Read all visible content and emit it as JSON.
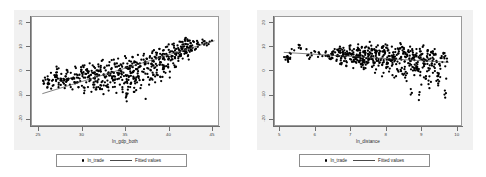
{
  "figure": {
    "background_color": "#ffffff",
    "plot_region_color": "#f1f1f1",
    "marker_color": "#000000",
    "fit_line_color": "#4a4a4a",
    "frame_color": "#9a9a9a"
  },
  "chart_data": [
    {
      "type": "scatter",
      "title": "",
      "xlabel": "ln_gdp_both",
      "ylabel": "",
      "xlim": [
        24.2,
        45.8
      ],
      "ylim": [
        -23.0,
        22.5
      ],
      "xticks": [
        25,
        30,
        35,
        40,
        45
      ],
      "yticks": [
        20,
        10,
        0,
        -10,
        -20
      ],
      "xtick_labels": [
        "25",
        "30",
        "35",
        "40",
        "45"
      ],
      "ytick_labels": [
        "20",
        "10",
        "0",
        "-10",
        "-20"
      ],
      "grid": false,
      "legend_position": "below",
      "legend": [
        "ln_trade",
        "Fitted values"
      ],
      "series": [
        {
          "name": "ln_trade",
          "kind": "scatter",
          "marker": "filled-circle",
          "x": [
            25.6,
            25.7,
            26.0,
            26.2,
            26.4,
            26.6,
            26.8,
            27.0,
            27.1,
            27.3,
            27.5,
            27.6,
            27.8,
            28.0,
            28.1,
            28.3,
            28.4,
            28.6,
            28.7,
            28.9,
            29.0,
            29.2,
            29.3,
            29.5,
            29.6,
            29.8,
            29.9,
            30.0,
            30.1,
            30.2,
            30.3,
            30.4,
            30.5,
            30.6,
            30.7,
            30.8,
            30.9,
            31.0,
            31.1,
            31.2,
            31.3,
            31.4,
            31.5,
            31.6,
            31.7,
            31.8,
            31.9,
            32.0,
            32.1,
            32.2,
            32.3,
            32.4,
            32.5,
            32.6,
            32.7,
            32.8,
            32.9,
            33.0,
            33.1,
            33.2,
            33.3,
            33.4,
            33.5,
            33.6,
            33.7,
            33.8,
            33.9,
            34.0,
            34.1,
            34.2,
            34.3,
            34.4,
            34.5,
            34.6,
            34.7,
            34.8,
            34.9,
            35.0,
            35.1,
            35.2,
            35.3,
            35.4,
            35.5,
            35.6,
            35.7,
            35.8,
            35.9,
            36.0,
            36.1,
            36.2,
            36.3,
            36.4,
            36.5,
            36.6,
            36.7,
            36.8,
            36.9,
            37.0,
            37.1,
            37.2,
            37.3,
            37.4,
            37.5,
            37.6,
            37.7,
            37.8,
            37.9,
            38.0,
            38.1,
            38.2,
            38.3,
            38.4,
            38.5,
            38.6,
            38.7,
            38.8,
            38.9,
            39.0,
            39.1,
            39.2,
            39.3,
            39.4,
            39.5,
            39.6,
            39.7,
            39.8,
            39.9,
            40.0,
            40.1,
            40.2,
            40.3,
            40.4,
            40.5,
            40.6,
            40.7,
            40.8,
            40.9,
            41.0,
            41.1,
            41.2,
            41.3,
            41.4,
            41.5,
            41.6,
            41.7,
            41.8,
            41.9,
            42.0,
            42.1,
            42.2,
            42.3,
            42.4,
            42.5,
            42.6,
            42.7,
            42.8,
            43.0,
            43.2,
            43.5,
            44.0,
            44.5,
            45.1
          ],
          "y": [
            -5.5,
            -3.0,
            -7.0,
            -4.0,
            -1.0,
            -6.5,
            -2.0,
            -4.5,
            0.5,
            -6.0,
            -3.5,
            -1.5,
            -5.0,
            -7.5,
            -2.5,
            0.0,
            -4.0,
            -6.0,
            -1.0,
            -8.0,
            -3.0,
            -5.5,
            1.0,
            -2.0,
            -7.0,
            -4.5,
            -0.5,
            -6.5,
            2.0,
            -3.0,
            -8.5,
            -1.5,
            -5.0,
            0.5,
            -7.0,
            -2.5,
            3.0,
            -4.0,
            -9.0,
            -1.0,
            -6.0,
            1.5,
            -3.5,
            -8.0,
            0.0,
            -5.0,
            2.5,
            -2.0,
            -7.5,
            -0.5,
            4.0,
            -4.5,
            -10.0,
            1.0,
            -3.0,
            -6.5,
            2.0,
            -1.5,
            -8.5,
            3.5,
            -5.0,
            0.5,
            -2.5,
            -7.0,
            4.5,
            -4.0,
            1.5,
            -9.5,
            -1.0,
            5.0,
            -3.5,
            -6.0,
            2.5,
            -0.5,
            -8.0,
            3.0,
            -5.5,
            6.0,
            -2.0,
            -13.0,
            1.0,
            -4.0,
            4.0,
            -7.0,
            2.0,
            -1.0,
            5.5,
            -3.0,
            -9.0,
            3.5,
            0.5,
            -5.0,
            6.5,
            -2.5,
            1.5,
            -7.5,
            4.5,
            -0.5,
            -4.0,
            7.0,
            2.5,
            -12.0,
            5.0,
            -1.5,
            3.0,
            -6.0,
            6.0,
            0.0,
            -3.5,
            8.0,
            4.0,
            1.0,
            -5.0,
            7.5,
            2.0,
            -2.0,
            5.5,
            9.0,
            3.5,
            -4.5,
            6.5,
            0.5,
            8.5,
            4.5,
            -1.0,
            7.0,
            10.0,
            2.5,
            5.0,
            -3.0,
            8.0,
            6.0,
            11.0,
            3.0,
            9.5,
            5.5,
            1.5,
            7.5,
            10.5,
            4.0,
            8.5,
            6.5,
            12.0,
            9.0,
            5.0,
            11.0,
            7.0,
            13.5,
            8.0,
            10.0,
            6.0,
            12.5,
            9.5,
            11.5,
            8.5,
            10.5,
            12.0,
            9.0,
            11.0,
            13.0,
            10.5,
            12.5,
            11.5,
            12.0,
            13.0,
            12.5
          ]
        },
        {
          "name": "Fitted values",
          "kind": "line",
          "x": [
            25.4,
            45.4
          ],
          "y": [
            -9.8,
            12.5
          ]
        }
      ]
    },
    {
      "type": "scatter",
      "title": "",
      "xlabel": "ln_distance",
      "ylabel": "",
      "xlim": [
        4.85,
        10.15
      ],
      "ylim": [
        -23.0,
        22.5
      ],
      "xticks": [
        5,
        6,
        7,
        8,
        9,
        10
      ],
      "yticks": [
        20,
        10,
        0,
        -10,
        -20
      ],
      "xtick_labels": [
        "5",
        "6",
        "7",
        "8",
        "9",
        "10"
      ],
      "ytick_labels": [
        "20",
        "10",
        "0",
        "-10",
        "-20"
      ],
      "grid": false,
      "legend_position": "below",
      "legend": [
        "ln_trade",
        "Fitted values"
      ],
      "series": [
        {
          "name": "ln_trade",
          "kind": "scatter",
          "marker": "filled-circle",
          "x": [
            5.15,
            5.2,
            5.25,
            5.3,
            5.55,
            5.8,
            5.85,
            6.1,
            6.2,
            6.3,
            6.4,
            6.45,
            6.5,
            6.55,
            6.6,
            6.65,
            6.7,
            6.72,
            6.75,
            6.78,
            6.8,
            6.85,
            6.88,
            6.9,
            6.95,
            7.0,
            7.02,
            7.05,
            7.08,
            7.1,
            7.12,
            7.15,
            7.18,
            7.2,
            7.22,
            7.25,
            7.28,
            7.3,
            7.32,
            7.35,
            7.38,
            7.4,
            7.42,
            7.45,
            7.48,
            7.5,
            7.52,
            7.55,
            7.58,
            7.6,
            7.62,
            7.65,
            7.68,
            7.7,
            7.72,
            7.75,
            7.78,
            7.8,
            7.82,
            7.85,
            7.88,
            7.9,
            7.92,
            7.95,
            7.98,
            8.0,
            8.02,
            8.05,
            8.08,
            8.1,
            8.12,
            8.15,
            8.18,
            8.2,
            8.22,
            8.25,
            8.28,
            8.3,
            8.32,
            8.35,
            8.38,
            8.4,
            8.42,
            8.45,
            8.48,
            8.5,
            8.52,
            8.55,
            8.58,
            8.6,
            8.62,
            8.65,
            8.68,
            8.7,
            8.72,
            8.75,
            8.78,
            8.8,
            8.82,
            8.85,
            8.88,
            8.9,
            8.92,
            8.95,
            8.98,
            9.0,
            9.02,
            9.05,
            9.08,
            9.1,
            9.12,
            9.15,
            9.18,
            9.2,
            9.22,
            9.25,
            9.28,
            9.3,
            9.32,
            9.35,
            9.38,
            9.4,
            9.45,
            9.5,
            9.55,
            9.6,
            9.65,
            9.7,
            9.75
          ],
          "y": [
            4.5,
            6.0,
            5.0,
            7.0,
            10.5,
            6.5,
            5.5,
            7.5,
            6.0,
            8.0,
            5.0,
            7.0,
            6.5,
            9.0,
            4.0,
            8.5,
            10.0,
            3.0,
            6.0,
            7.5,
            9.5,
            5.0,
            2.0,
            8.0,
            6.5,
            10.5,
            4.5,
            7.0,
            1.0,
            9.0,
            5.5,
            3.5,
            8.5,
            6.0,
            11.0,
            4.0,
            7.5,
            2.5,
            9.5,
            5.0,
            0.5,
            8.0,
            6.5,
            10.0,
            3.0,
            7.0,
            4.5,
            12.0,
            5.5,
            8.5,
            1.5,
            6.0,
            9.0,
            -1.0,
            7.5,
            4.0,
            10.5,
            2.0,
            6.5,
            8.0,
            5.0,
            -2.5,
            9.5,
            3.5,
            7.0,
            11.0,
            1.0,
            5.5,
            8.5,
            -0.5,
            6.0,
            4.0,
            10.0,
            2.5,
            7.5,
            -3.0,
            9.0,
            5.0,
            6.5,
            0.0,
            8.0,
            3.0,
            11.5,
            4.5,
            -1.5,
            7.0,
            9.5,
            1.5,
            5.5,
            -4.5,
            6.0,
            8.5,
            2.0,
            10.0,
            4.0,
            -9.5,
            7.5,
            5.0,
            -2.0,
            6.5,
            9.0,
            0.5,
            3.5,
            -12.5,
            8.0,
            5.5,
            -6.0,
            7.0,
            10.5,
            2.5,
            4.5,
            -3.5,
            6.0,
            8.5,
            1.0,
            -7.5,
            5.0,
            7.5,
            3.0,
            -1.0,
            6.5,
            9.0,
            4.0,
            -5.5,
            2.0,
            6.0,
            7.0,
            -11.5,
            5.0
          ],
          "y_note": "values above are approximate read-offs of the point cloud"
        },
        {
          "name": "Fitted values",
          "kind": "line",
          "x": [
            5.1,
            9.8
          ],
          "y": [
            7.6,
            3.4
          ]
        }
      ]
    }
  ]
}
